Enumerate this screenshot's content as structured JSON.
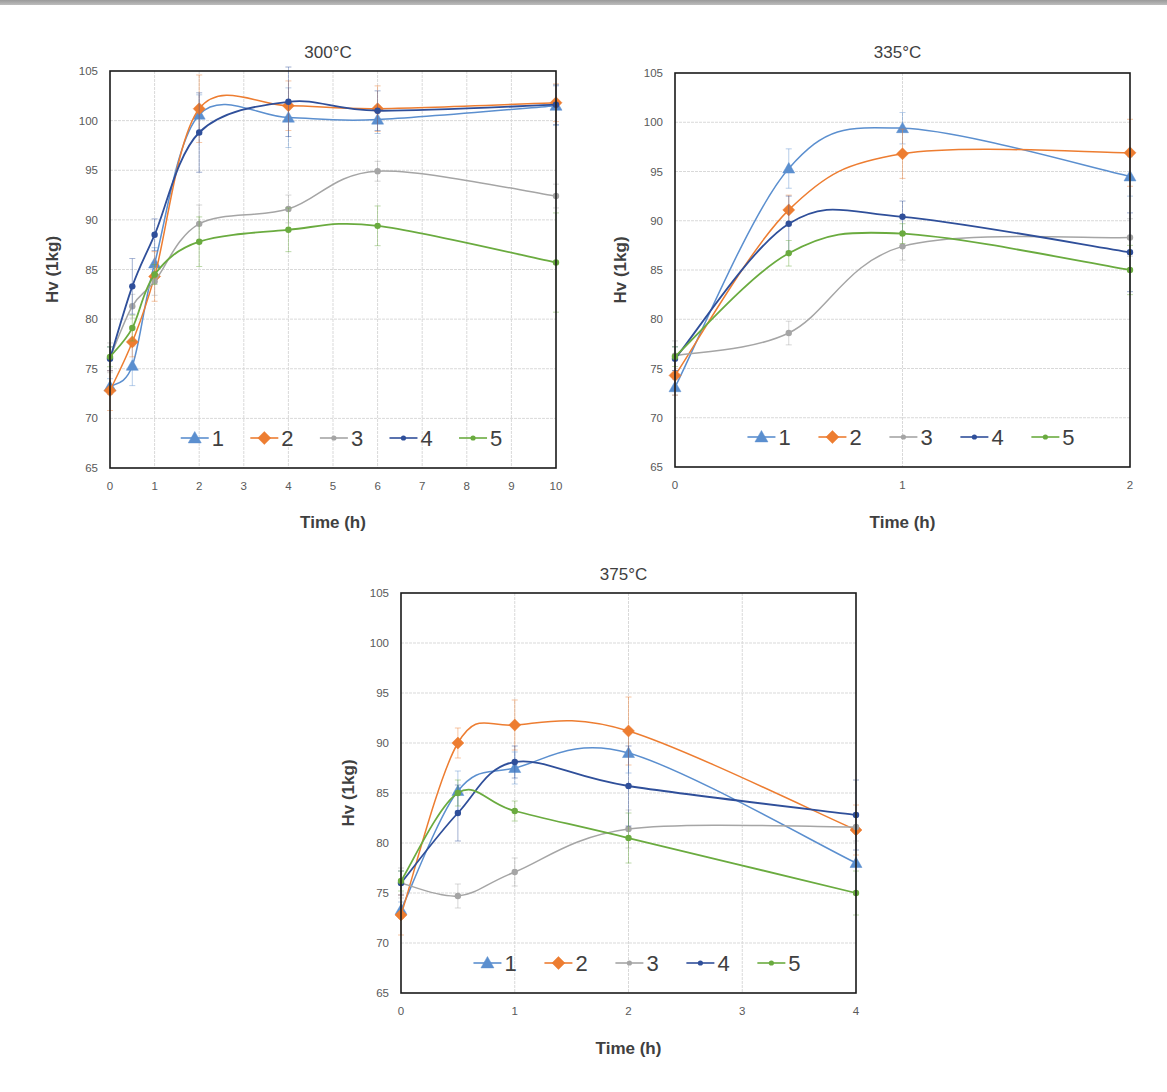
{
  "figure": {
    "caption_visible": false
  },
  "style": {
    "series_colors": [
      "#5b8fcf",
      "#ed7d31",
      "#a5a5a5",
      "#2f4f9a",
      "#6aab3f"
    ],
    "series_markers": [
      "triangle",
      "diamond",
      "circle",
      "circle",
      "circle"
    ],
    "frame_color": "#1a1a1a",
    "grid_color": "#d9d9d9",
    "tick_label_color": "#595959",
    "axis_title_color": "#404040"
  },
  "chart_data": [
    {
      "id": "chart-300",
      "type": "line",
      "title": "300°C",
      "xlabel": "Time (h)",
      "ylabel": "Hv (1kg)",
      "xlim": [
        0,
        10
      ],
      "ylim": [
        65,
        105
      ],
      "xticks": [
        0,
        1,
        2,
        3,
        4,
        5,
        6,
        7,
        8,
        9,
        10
      ],
      "yticks": [
        65,
        70,
        75,
        80,
        85,
        90,
        95,
        100,
        105
      ],
      "grid": true,
      "legend_position": "inside-bottom",
      "x": [
        0,
        0.5,
        1,
        2,
        4,
        6,
        10
      ],
      "series": [
        {
          "name": "1",
          "values": [
            73.2,
            75.3,
            85.6,
            100.6,
            100.3,
            100.1,
            101.5
          ]
        },
        {
          "name": "2",
          "values": [
            72.8,
            77.7,
            84.3,
            101.2,
            101.5,
            101.2,
            101.8
          ]
        },
        {
          "name": "3",
          "values": [
            76.1,
            81.3,
            83.8,
            89.6,
            91.1,
            94.9,
            92.4
          ]
        },
        {
          "name": "4",
          "values": [
            76.0,
            83.3,
            88.5,
            98.8,
            101.9,
            101.0,
            101.6
          ]
        },
        {
          "name": "5",
          "values": [
            76.2,
            79.1,
            84.5,
            87.8,
            89.0,
            89.4,
            85.7
          ]
        }
      ],
      "error_bars": "present (approx. ±1–4 Hv)"
    },
    {
      "id": "chart-335",
      "type": "line",
      "title": "335°C",
      "xlabel": "Time (h)",
      "ylabel": "Hv (1kg)",
      "xlim": [
        0,
        2
      ],
      "ylim": [
        65,
        105
      ],
      "xticks": [
        0,
        1,
        2
      ],
      "yticks": [
        65,
        70,
        75,
        80,
        85,
        90,
        95,
        100,
        105
      ],
      "grid": true,
      "legend_position": "inside-bottom",
      "x": [
        0,
        0.5,
        1,
        2
      ],
      "series": [
        {
          "name": "1",
          "values": [
            73.1,
            95.3,
            99.4,
            94.5
          ]
        },
        {
          "name": "2",
          "values": [
            74.3,
            91.1,
            96.8,
            96.9
          ]
        },
        {
          "name": "3",
          "values": [
            76.3,
            78.6,
            87.4,
            88.3
          ]
        },
        {
          "name": "4",
          "values": [
            76.0,
            89.7,
            90.4,
            86.8
          ]
        },
        {
          "name": "5",
          "values": [
            76.2,
            86.7,
            88.7,
            85.0
          ]
        }
      ],
      "error_bars": "present (approx. ±1–3 Hv)"
    },
    {
      "id": "chart-375",
      "type": "line",
      "title": "375°C",
      "xlabel": "Time (h)",
      "ylabel": "Hv (1kg)",
      "xlim": [
        0,
        4
      ],
      "ylim": [
        65,
        105
      ],
      "xticks": [
        0,
        1,
        2,
        3,
        4
      ],
      "yticks": [
        65,
        70,
        75,
        80,
        85,
        90,
        95,
        100,
        105
      ],
      "grid": true,
      "legend_position": "inside-bottom",
      "x": [
        0,
        0.5,
        1,
        2,
        4
      ],
      "series": [
        {
          "name": "1",
          "values": [
            73.3,
            85.2,
            87.5,
            89.0,
            78.0
          ]
        },
        {
          "name": "2",
          "values": [
            72.8,
            90.0,
            91.8,
            91.2,
            81.3
          ]
        },
        {
          "name": "3",
          "values": [
            76.0,
            74.7,
            77.1,
            81.4,
            81.6
          ]
        },
        {
          "name": "4",
          "values": [
            76.0,
            83.0,
            88.1,
            85.7,
            82.8
          ]
        },
        {
          "name": "5",
          "values": [
            76.2,
            85.0,
            83.2,
            80.5,
            75.0
          ]
        }
      ],
      "error_bars": "present (approx. ±1–3 Hv)"
    }
  ],
  "layout": [
    {
      "left": 110,
      "top": 71,
      "right": 556,
      "bottom": 468,
      "title_y": 50,
      "xlabel_y": 522,
      "ylabel_x": 52
    },
    {
      "left": 675,
      "top": 73,
      "right": 1130,
      "bottom": 467,
      "title_y": 50,
      "xlabel_y": 522,
      "ylabel_x": 620
    },
    {
      "left": 401,
      "top": 593,
      "right": 856,
      "bottom": 993,
      "title_y": 572,
      "xlabel_y": 1048,
      "ylabel_x": 348
    }
  ]
}
